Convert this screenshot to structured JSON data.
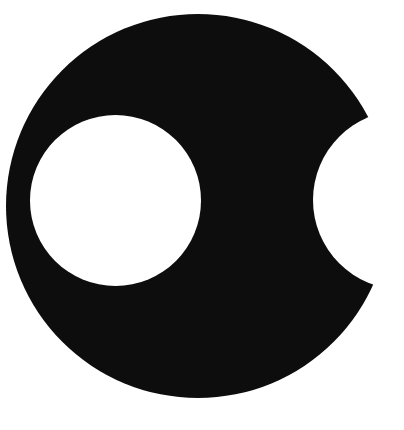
{
  "figure": {
    "width": 404,
    "height": 430,
    "background": "#ffffff",
    "shape_color": "#0d0d0d",
    "outer_disc": {
      "cx": 198,
      "cy": 206,
      "r": 192
    },
    "inner_hole": {
      "cx": 115.5,
      "cy": 200.5,
      "r": 85.5
    },
    "notch": {
      "cx": 402.5,
      "cy": 200,
      "r": 89.5
    }
  }
}
